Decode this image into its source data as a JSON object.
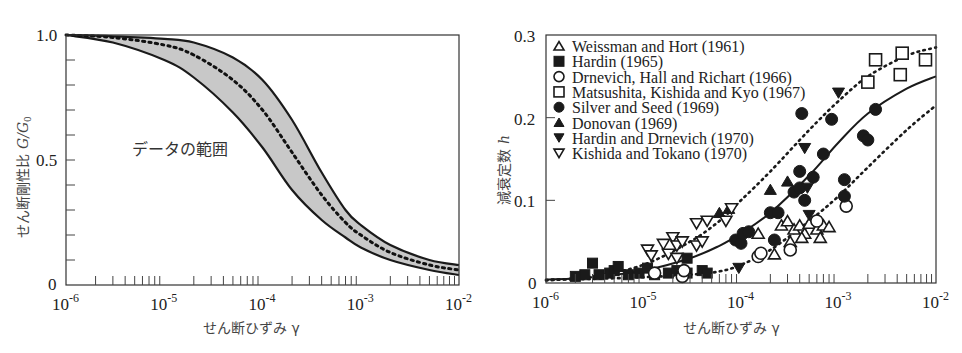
{
  "chart_data": [
    {
      "type": "area",
      "id": "left",
      "title": "",
      "xlabel": "せん断ひずみ γ",
      "ylabel": "せん断剛性比 G/G0",
      "xscale": "log",
      "xlim": [
        1e-06,
        0.01
      ],
      "ylim": [
        0,
        1.0
      ],
      "xticks": [
        "10-6",
        "10-5",
        "10-4",
        "10-3",
        "10-2"
      ],
      "yticks": [
        "0",
        "0.5",
        "1.0"
      ],
      "annotation": "データの範囲",
      "grid": false,
      "series": [
        {
          "name": "upper bound",
          "style": "solid",
          "x": [
            1e-06,
            3e-06,
            1e-05,
            2e-05,
            5e-05,
            0.0001,
            0.0002,
            0.0004,
            0.0007,
            0.001,
            0.002,
            0.005,
            0.01
          ],
          "y": [
            1.0,
            0.995,
            0.985,
            0.97,
            0.91,
            0.82,
            0.66,
            0.45,
            0.3,
            0.24,
            0.16,
            0.1,
            0.08
          ]
        },
        {
          "name": "mean",
          "style": "dotted",
          "x": [
            1e-06,
            3e-06,
            1e-05,
            2e-05,
            5e-05,
            0.0001,
            0.0002,
            0.0004,
            0.0007,
            0.001,
            0.002,
            0.005,
            0.01
          ],
          "y": [
            1.0,
            0.99,
            0.96,
            0.92,
            0.82,
            0.7,
            0.53,
            0.36,
            0.25,
            0.2,
            0.13,
            0.08,
            0.06
          ]
        },
        {
          "name": "lower bound",
          "style": "solid",
          "x": [
            1e-06,
            3e-06,
            1e-05,
            2e-05,
            5e-05,
            0.0001,
            0.0002,
            0.0004,
            0.0007,
            0.001,
            0.002,
            0.005,
            0.01
          ],
          "y": [
            1.0,
            0.97,
            0.9,
            0.83,
            0.69,
            0.55,
            0.38,
            0.26,
            0.19,
            0.15,
            0.1,
            0.06,
            0.04
          ]
        }
      ]
    },
    {
      "type": "scatter",
      "id": "right",
      "title": "",
      "xlabel": "せん断ひずみ γ",
      "ylabel": "減衰定数 h",
      "xscale": "log",
      "xlim": [
        1e-06,
        0.01
      ],
      "ylim": [
        0,
        0.3
      ],
      "xticks": [
        "10-6",
        "10-5",
        "10-4",
        "10-3",
        "10-2"
      ],
      "yticks": [
        "0",
        "0.1",
        "0.2",
        "0.3"
      ],
      "grid": false,
      "legend_position": "upper left",
      "legend": [
        {
          "label": "Weissman and Hort (1961)",
          "marker": "triangle-open"
        },
        {
          "label": "Hardin (1965)",
          "marker": "square-filled"
        },
        {
          "label": "Drnevich, Hall and Richart (1966)",
          "marker": "circle-open"
        },
        {
          "label": "Matsushita, Kishida and Kyo (1967)",
          "marker": "square-open"
        },
        {
          "label": "Silver and Seed (1969)",
          "marker": "circle-filled"
        },
        {
          "label": "Donovan (1969)",
          "marker": "triangle-filled"
        },
        {
          "label": "Hardin and Drnevich (1970)",
          "marker": "triangle-down-filled"
        },
        {
          "label": "Kishida and Tokano (1970)",
          "marker": "triangle-down-open"
        }
      ],
      "curves": [
        {
          "name": "mean",
          "style": "solid",
          "x": [
            1e-06,
            3e-06,
            1e-05,
            3e-05,
            6e-05,
            0.0001,
            0.0002,
            0.0005,
            0.001,
            0.002,
            0.005,
            0.01
          ],
          "y": [
            0.004,
            0.007,
            0.015,
            0.03,
            0.045,
            0.06,
            0.085,
            0.13,
            0.17,
            0.205,
            0.235,
            0.25
          ]
        },
        {
          "name": "upper bound",
          "style": "dotted",
          "x": [
            1e-06,
            3e-06,
            1e-05,
            3e-05,
            6e-05,
            0.0001,
            0.0002,
            0.0005,
            0.001,
            0.002,
            0.005,
            0.01
          ],
          "y": [
            0.003,
            0.008,
            0.022,
            0.05,
            0.075,
            0.1,
            0.135,
            0.185,
            0.22,
            0.25,
            0.275,
            0.285
          ]
        },
        {
          "name": "lower bound",
          "style": "dotted",
          "x": [
            1e-06,
            3e-06,
            1e-05,
            3e-05,
            6e-05,
            0.0001,
            0.0002,
            0.0005,
            0.001,
            0.002,
            0.005,
            0.01
          ],
          "y": [
            0.004,
            0.005,
            0.007,
            0.01,
            0.014,
            0.022,
            0.04,
            0.075,
            0.105,
            0.14,
            0.185,
            0.215
          ]
        }
      ],
      "series": [
        {
          "name": "Weissman and Hort (1961)",
          "marker": "triangle-open",
          "points": [
            [
              0.00015,
              0.06
            ],
            [
              0.00022,
              0.035
            ],
            [
              0.00026,
              0.07
            ],
            [
              0.0003,
              0.075
            ],
            [
              0.00032,
              0.05
            ],
            [
              0.00035,
              0.065
            ],
            [
              0.0004,
              0.07
            ],
            [
              0.00045,
              0.06
            ],
            [
              0.0005,
              0.072
            ],
            [
              0.0006,
              0.065
            ],
            [
              0.0007,
              0.07
            ],
            [
              0.0008,
              0.068
            ],
            [
              0.00065,
              0.055
            ],
            [
              0.00042,
              0.055
            ]
          ]
        },
        {
          "name": "Hardin (1965)",
          "marker": "square-filled",
          "points": [
            [
              2e-06,
              0.008
            ],
            [
              2.5e-06,
              0.01
            ],
            [
              3e-06,
              0.024
            ],
            [
              3.5e-06,
              0.01
            ],
            [
              4.5e-06,
              0.012
            ],
            [
              5e-06,
              0.015
            ],
            [
              5.5e-06,
              0.02
            ],
            [
              7e-06,
              0.01
            ],
            [
              9e-06,
              0.012
            ],
            [
              1.1e-05,
              0.018
            ],
            [
              1.3e-05,
              0.01
            ],
            [
              1.8e-05,
              0.012
            ],
            [
              2.2e-05,
              0.015
            ],
            [
              2.8e-05,
              0.03
            ],
            [
              2.8e-05,
              0.012
            ],
            [
              4e-05,
              0.015
            ],
            [
              4.5e-05,
              0.012
            ]
          ]
        },
        {
          "name": "Drnevich, Hall and Richart (1966)",
          "marker": "circle-open",
          "points": [
            [
              1.3e-05,
              0.012
            ],
            [
              2.5e-05,
              0.008
            ],
            [
              2.6e-05,
              0.015
            ],
            [
              0.00015,
              0.032
            ],
            [
              0.00016,
              0.036
            ],
            [
              0.00032,
              0.04
            ],
            [
              0.0006,
              0.075
            ],
            [
              0.0012,
              0.093
            ]
          ]
        },
        {
          "name": "Matsushita, Kishida and Kyo (1967)",
          "marker": "square-open",
          "points": [
            [
              0.002,
              0.243
            ],
            [
              0.0024,
              0.27
            ],
            [
              0.0043,
              0.252
            ],
            [
              0.0045,
              0.278
            ],
            [
              0.0078,
              0.27
            ]
          ]
        },
        {
          "name": "Silver and Seed (1969)",
          "marker": "circle-filled",
          "points": [
            [
              8.8e-05,
              0.052
            ],
            [
              0.0001,
              0.048
            ],
            [
              0.000105,
              0.06
            ],
            [
              0.00012,
              0.062
            ],
            [
              0.0002,
              0.085
            ],
            [
              0.00024,
              0.085
            ],
            [
              0.00022,
              0.052
            ],
            [
              0.00035,
              0.11
            ],
            [
              0.0004,
              0.135
            ],
            [
              0.0004,
              0.115
            ],
            [
              0.00042,
              0.205
            ],
            [
              0.00045,
              0.1
            ],
            [
              0.00055,
              0.128
            ],
            [
              0.0007,
              0.156
            ],
            [
              0.00085,
              0.198
            ],
            [
              0.00115,
              0.125
            ],
            [
              0.00115,
              0.105
            ],
            [
              0.0018,
              0.178
            ],
            [
              0.002,
              0.173
            ],
            [
              0.0024,
              0.21
            ]
          ]
        },
        {
          "name": "Donovan (1969)",
          "marker": "triangle-filled",
          "points": [
            [
              6e-05,
              0.085
            ],
            [
              7.5e-05,
              0.09
            ],
            [
              0.0002,
              0.113
            ],
            [
              0.0003,
              0.123
            ]
          ]
        },
        {
          "name": "Hardin and Drnevich (1970)",
          "marker": "triangle-down-filled",
          "points": [
            [
              9.5e-05,
              0.018
            ],
            [
              0.00045,
              0.163
            ],
            [
              0.00048,
              0.115
            ],
            [
              0.0005,
              0.082
            ],
            [
              0.001,
              0.23
            ]
          ]
        },
        {
          "name": "Kishida and Tokano (1970)",
          "marker": "triangle-down-open",
          "points": [
            [
              1.1e-05,
              0.04
            ],
            [
              1.2e-05,
              0.033
            ],
            [
              1.6e-05,
              0.047
            ],
            [
              1.8e-05,
              0.035
            ],
            [
              2e-05,
              0.055
            ],
            [
              2.2e-05,
              0.045
            ],
            [
              2.5e-05,
              0.05
            ],
            [
              3.5e-05,
              0.045
            ],
            [
              4e-05,
              0.05
            ],
            [
              3.5e-05,
              0.072
            ],
            [
              4.5e-05,
              0.075
            ],
            [
              7e-05,
              0.075
            ],
            [
              8e-05,
              0.09
            ],
            [
              2.2e-05,
              0.03
            ]
          ]
        }
      ]
    }
  ],
  "left_chart": {
    "ylabel": "せん断剛性比",
    "ylabel_symbol": "G/G",
    "ylabel_sub": "0",
    "xlabel": "せん断ひずみ γ",
    "annotation": "データの範囲",
    "yticks": [
      "1.0",
      "0.5",
      "0"
    ],
    "xticks_base": "10",
    "xticks_exp": [
      "-6",
      "-5",
      "-4",
      "-3",
      "-2"
    ]
  },
  "right_chart": {
    "ylabel": "減衰定数",
    "ylabel_symbol": "h",
    "xlabel": "せん断ひずみ γ",
    "yticks": [
      "0.3",
      "0.2",
      "0.1",
      "0"
    ],
    "xticks_base": "10",
    "xticks_exp": [
      "-6",
      "-5",
      "-4",
      "-3",
      "-2"
    ],
    "legend": [
      "Weissman and Hort (1961)",
      "Hardin (1965)",
      "Drnevich, Hall and Richart (1966)",
      "Matsushita, Kishida and Kyo (1967)",
      "Silver and Seed (1969)",
      "Donovan (1969)",
      "Hardin and Drnevich (1970)",
      "Kishida and Tokano (1970)"
    ]
  },
  "colors": {
    "ink": "#1a1a1a",
    "band_fill": "#c8c8c8",
    "axis_text": "#222222"
  }
}
